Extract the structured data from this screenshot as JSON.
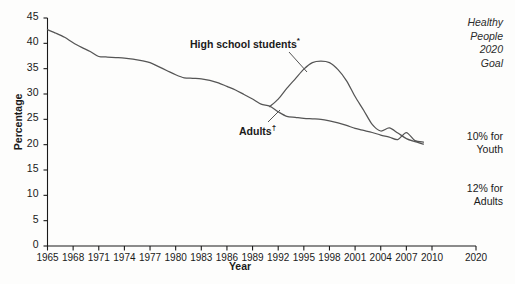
{
  "chart_data": {
    "type": "line",
    "title": "",
    "xlabel": "Year",
    "ylabel": "Percentage",
    "xlim": [
      1965,
      2020
    ],
    "ylim": [
      0,
      45
    ],
    "grid": false,
    "legend_position": "inline-annotations",
    "x_ticks": [
      "1965",
      "1968",
      "1971",
      "1974",
      "1977",
      "1980",
      "1983",
      "1986",
      "1989",
      "1992",
      "1995",
      "1998",
      "2001",
      "2004",
      "2007",
      "2010",
      "2020"
    ],
    "y_ticks": [
      "0",
      "5",
      "10",
      "15",
      "20",
      "25",
      "30",
      "35",
      "40",
      "45"
    ],
    "series": [
      {
        "name": "Adults",
        "label": "Adults",
        "label_marker": "†",
        "color": "#555555",
        "x": [
          1965,
          1966,
          1967,
          1968,
          1969,
          1970,
          1971,
          1972,
          1973,
          1974,
          1975,
          1976,
          1977,
          1978,
          1979,
          1980,
          1981,
          1982,
          1983,
          1984,
          1985,
          1986,
          1987,
          1988,
          1989,
          1990,
          1991,
          1992,
          1993,
          1994,
          1995,
          1996,
          1997,
          1998,
          1999,
          2000,
          2001,
          2002,
          2003,
          2004,
          2005,
          2006,
          2007,
          2008,
          2009
        ],
        "values": [
          42.7,
          42.0,
          41.2,
          40.1,
          39.2,
          38.4,
          37.4,
          37.3,
          37.2,
          37.1,
          36.9,
          36.6,
          36.2,
          35.4,
          34.6,
          33.8,
          33.2,
          33.1,
          33.0,
          32.7,
          32.2,
          31.5,
          30.8,
          29.9,
          29.0,
          28.0,
          27.6,
          26.5,
          25.6,
          25.4,
          25.2,
          25.1,
          25.0,
          24.7,
          24.3,
          23.8,
          23.2,
          22.8,
          22.4,
          21.9,
          21.5,
          21.0,
          22.4,
          20.8,
          20.5
        ]
      },
      {
        "name": "High school students",
        "label": "High school students",
        "label_marker": "*",
        "color": "#555555",
        "x": [
          1991,
          1992,
          1993,
          1994,
          1995,
          1996,
          1997,
          1998,
          1999,
          2000,
          2001,
          2002,
          2003,
          2004,
          2005,
          2006,
          2007,
          2008,
          2009
        ],
        "values": [
          27.5,
          29.0,
          31.1,
          33.0,
          34.9,
          36.2,
          36.5,
          36.2,
          34.8,
          32.6,
          29.5,
          26.8,
          24.0,
          22.7,
          23.3,
          22.3,
          21.2,
          20.6,
          20.1
        ]
      }
    ]
  },
  "annotations": {
    "hs_label_text": "High school students",
    "hs_label_marker": "*",
    "adults_label_text": "Adults",
    "adults_label_marker": "†"
  },
  "goal_box": {
    "title_lines": [
      "Healthy",
      "People",
      "2020",
      "Goal"
    ],
    "youth_lines": [
      "10% for",
      "Youth"
    ],
    "adults_lines": [
      "12% for",
      "Adults"
    ]
  },
  "axes": {
    "y_title": "Percentage",
    "x_title": "Year"
  },
  "colors": {
    "line": "#555555",
    "axis": "#1a1a1a",
    "text": "#1a1a1a",
    "background": "#fdfdfc"
  }
}
